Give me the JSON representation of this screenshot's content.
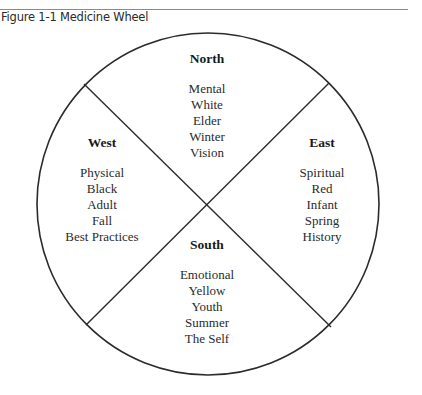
{
  "caption": "Figure 1-1 Medicine Wheel",
  "colors": {
    "line": "#2b2b2b",
    "text": "#2b2b2b",
    "rule": "#8a8a8a",
    "background": "#ffffff"
  },
  "wheel": {
    "center": [
      207,
      204
    ],
    "radius": 171
  },
  "quadrants": {
    "north": {
      "heading": "North",
      "items": [
        "Mental",
        "White",
        "Elder",
        "Winter",
        "Vision"
      ]
    },
    "west": {
      "heading": "West",
      "items": [
        "Physical",
        "Black",
        "Adult",
        "Fall",
        "Best Practices"
      ]
    },
    "east": {
      "heading": "East",
      "items": [
        "Spiritual",
        "Red",
        "Infant",
        "Spring",
        "History"
      ]
    },
    "south": {
      "heading": "South",
      "items": [
        "Emotional",
        "Yellow",
        "Youth",
        "Summer",
        "The Self"
      ]
    }
  }
}
